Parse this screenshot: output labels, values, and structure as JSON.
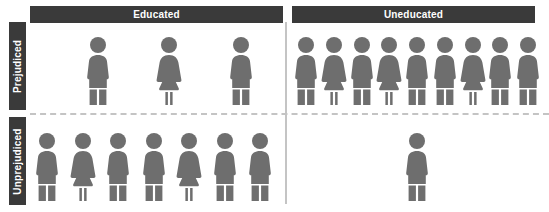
{
  "chart_data": {
    "type": "pictogram",
    "title": "",
    "xlabel": "",
    "ylabel": "",
    "icon_unit": 1,
    "icon_shapes": [
      "male",
      "female"
    ],
    "column_headers": [
      "Educated",
      "Uneducated"
    ],
    "row_headers": [
      "Prejudiced",
      "Unprejudiced"
    ],
    "categories": [
      "Educated",
      "Uneducated"
    ],
    "series": [
      {
        "name": "Prejudiced",
        "values": [
          3,
          9
        ]
      },
      {
        "name": "Unprejudiced",
        "values": [
          7,
          1
        ]
      }
    ],
    "cells": [
      {
        "row": "Prejudiced",
        "column": "Educated",
        "count": 3,
        "genders": [
          "male",
          "female",
          "male"
        ]
      },
      {
        "row": "Prejudiced",
        "column": "Uneducated",
        "count": 9,
        "genders": [
          "male",
          "female",
          "male",
          "female",
          "male",
          "male",
          "female",
          "male",
          "male"
        ]
      },
      {
        "row": "Unprejudiced",
        "column": "Educated",
        "count": 7,
        "genders": [
          "male",
          "female",
          "male",
          "male",
          "female",
          "male",
          "male"
        ]
      },
      {
        "row": "Unprejudiced",
        "column": "Uneducated",
        "count": 1,
        "genders": [
          "male"
        ]
      }
    ],
    "colors": {
      "figure": "#6e6e6e",
      "header_bar": "#3a3a3a",
      "header_text": "#ffffff",
      "divider": "#c4c4c4",
      "background": "#ffffff"
    },
    "legend": [],
    "grid": false
  },
  "headers": {
    "columns": {
      "educated": "Educated",
      "uneducated": "Uneducated"
    },
    "rows": {
      "prejudiced": "Prejudiced",
      "unprejudiced": "Unprejudiced"
    }
  }
}
